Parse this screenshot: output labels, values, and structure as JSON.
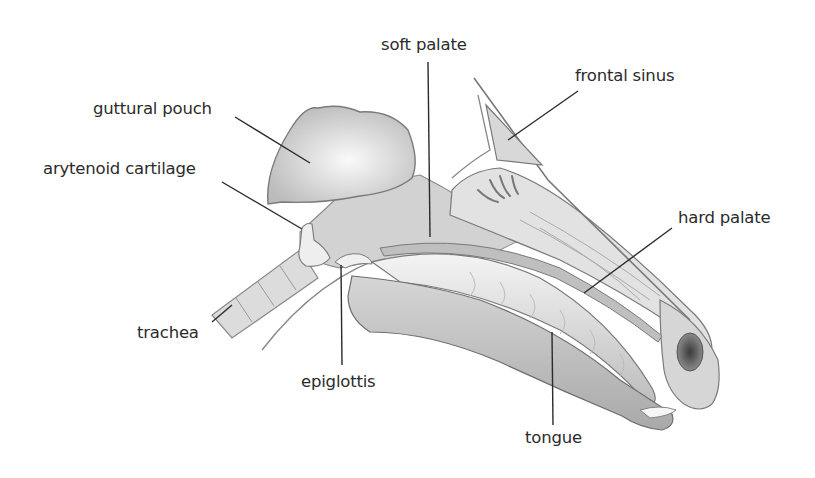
{
  "diagram": {
    "labels": [
      {
        "id": "soft-palate",
        "text": "soft palate",
        "x": 381,
        "y": 37,
        "line": [
          [
            428,
            62
          ],
          [
            430,
            237
          ]
        ]
      },
      {
        "id": "frontal-sinus",
        "text": "frontal sinus",
        "x": 575,
        "y": 68,
        "line": [
          [
            578,
            91
          ],
          [
            508,
            140
          ]
        ]
      },
      {
        "id": "guttural-pouch",
        "text": "guttural pouch",
        "x": 93,
        "y": 101,
        "line": [
          [
            235,
            117
          ],
          [
            310,
            163
          ]
        ]
      },
      {
        "id": "arytenoid-cartilage",
        "text": "arytenoid cartilage",
        "x": 43,
        "y": 161,
        "line": [
          [
            222,
            182
          ],
          [
            302,
            229
          ]
        ]
      },
      {
        "id": "hard-palate",
        "text": "hard palate",
        "x": 678,
        "y": 210,
        "line": [
          [
            672,
            228
          ],
          [
            584,
            293
          ]
        ]
      },
      {
        "id": "trachea",
        "text": "trachea",
        "x": 137,
        "y": 325,
        "line": [
          [
            212,
            322
          ],
          [
            232,
            305
          ]
        ]
      },
      {
        "id": "epiglottis",
        "text": "epiglottis",
        "x": 301,
        "y": 374,
        "line": [
          [
            341,
            265
          ],
          [
            342,
            365
          ]
        ]
      },
      {
        "id": "tongue",
        "text": "tongue",
        "x": 525,
        "y": 430,
        "line": [
          [
            552,
            332
          ],
          [
            553,
            425
          ]
        ]
      }
    ],
    "colors": {
      "text": "#2b2b2b",
      "line": "#2b2b2b",
      "outline": "#6a6a6a",
      "fill_light": "#e6e6e6",
      "fill_mid": "#c8c8c8",
      "fill_dark": "#5a5a5a"
    }
  }
}
